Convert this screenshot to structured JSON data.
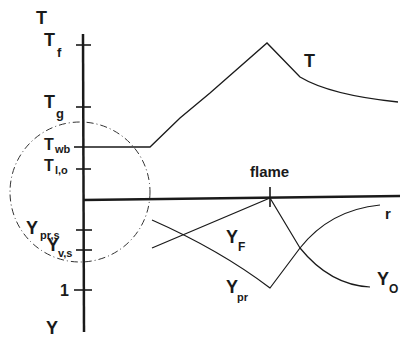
{
  "diagram": {
    "axis_labels": {
      "top": "T",
      "bottom": "Y"
    },
    "ticks": [
      {
        "id": "tf",
        "main": "T",
        "sub": "f",
        "y": 45
      },
      {
        "id": "tg",
        "main": "T",
        "sub": "g",
        "y": 107
      },
      {
        "id": "twb",
        "main": "T",
        "sub": "wb",
        "y": 147
      },
      {
        "id": "tlo",
        "main": "T",
        "sub": "l,o",
        "y": 169
      },
      {
        "id": "yprs",
        "main": "Y",
        "sub": "pr,s",
        "y": 230
      },
      {
        "id": "yvs",
        "main": "Y",
        "sub": "v,s",
        "y": 250
      },
      {
        "id": "one",
        "main": "1",
        "sub": "",
        "y": 290
      }
    ],
    "curve_labels": {
      "temperature": "T",
      "flame": "flame",
      "radius": "r",
      "fuel_main": "Y",
      "fuel_sub": "F",
      "product_main": "Y",
      "product_sub": "pr",
      "oxidizer_main": "Y",
      "oxidizer_sub": "O"
    },
    "colors": {
      "ink": "#1a1a1a",
      "background": "#ffffff"
    }
  }
}
